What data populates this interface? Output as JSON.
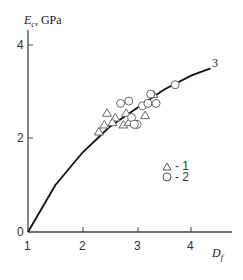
{
  "chart_data": {
    "type": "scatter",
    "title": "",
    "xlabel": "D_f",
    "ylabel": "E_c, GPa",
    "xlim": [
      1,
      4.6
    ],
    "ylim": [
      0,
      4.2
    ],
    "x_ticks": [
      "1",
      "2",
      "3",
      "4"
    ],
    "y_ticks": [
      "0",
      "2",
      "4"
    ],
    "grid": false,
    "legend_position": "lower right",
    "series": [
      {
        "name": "1",
        "marker": "triangle",
        "points": [
          [
            2.3,
            2.15
          ],
          [
            2.4,
            2.3
          ],
          [
            2.45,
            2.55
          ],
          [
            2.6,
            2.45
          ],
          [
            2.55,
            2.35
          ],
          [
            2.75,
            2.3
          ],
          [
            2.8,
            2.55
          ],
          [
            2.85,
            2.35
          ],
          [
            3.15,
            2.5
          ],
          [
            3.3,
            2.95
          ]
        ]
      },
      {
        "name": "2",
        "marker": "circle",
        "points": [
          [
            2.7,
            2.75
          ],
          [
            2.85,
            2.8
          ],
          [
            2.9,
            2.45
          ],
          [
            3.0,
            2.3
          ],
          [
            3.1,
            2.7
          ],
          [
            3.25,
            2.95
          ],
          [
            3.2,
            2.75
          ],
          [
            3.35,
            2.75
          ],
          [
            3.7,
            3.15
          ],
          [
            2.95,
            2.3
          ]
        ]
      },
      {
        "name": "3",
        "type": "line",
        "points": [
          [
            1.0,
            0.0
          ],
          [
            1.5,
            1.0
          ],
          [
            2.0,
            1.7
          ],
          [
            2.5,
            2.25
          ],
          [
            3.0,
            2.65
          ],
          [
            3.5,
            3.05
          ],
          [
            4.0,
            3.35
          ],
          [
            4.35,
            3.5
          ]
        ]
      }
    ],
    "annotations": [
      "3"
    ],
    "legend": [
      "△ - 1",
      "○ - 2"
    ]
  },
  "labels": {
    "ylabel_main": "E",
    "ylabel_sub": "c",
    "ylabel_unit": ", GPa",
    "xlabel_main": "D",
    "xlabel_sub": "f",
    "curve_label": "3",
    "legend_1": "- 1",
    "legend_2": "- 2",
    "tick_x": [
      "1",
      "2",
      "3",
      "4"
    ],
    "tick_y": [
      "0",
      "2",
      "4"
    ]
  }
}
